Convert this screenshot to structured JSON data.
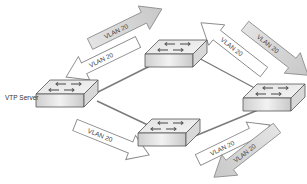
{
  "diagram": {
    "type": "network-topology",
    "server_label": "VTP Server",
    "arrow_label": "VLAN 20",
    "colors": {
      "link": "#7a7a7a",
      "arrow_filled": "#d4d4d4",
      "arrow_outline": "#8a8a8a",
      "switch_top": "#e8e8e8",
      "switch_front": "#d0d0d0",
      "switch_side": "#bdbdbd"
    },
    "switches": [
      {
        "id": "sw-left",
        "role": "VTP Server"
      },
      {
        "id": "sw-top",
        "role": ""
      },
      {
        "id": "sw-right",
        "role": ""
      },
      {
        "id": "sw-bottom",
        "role": ""
      }
    ],
    "links": [
      {
        "from": "sw-left",
        "to": "sw-top"
      },
      {
        "from": "sw-top",
        "to": "sw-right"
      },
      {
        "from": "sw-left",
        "to": "sw-bottom"
      },
      {
        "from": "sw-bottom",
        "to": "sw-right"
      }
    ],
    "arrows": [
      {
        "label": "VLAN 20",
        "style": "filled",
        "direction": "outbound",
        "near": "sw-top-left"
      },
      {
        "label": "VLAN 20",
        "style": "outline",
        "direction": "inbound",
        "near": "sw-left"
      },
      {
        "label": "VLAN 20",
        "style": "outline",
        "direction": "inbound",
        "near": "sw-top-right"
      },
      {
        "label": "VLAN 20",
        "style": "filled",
        "direction": "outbound",
        "near": "sw-right"
      },
      {
        "label": "VLAN 20",
        "style": "outline",
        "direction": "outbound",
        "near": "sw-bottom"
      },
      {
        "label": "VLAN 20",
        "style": "outline",
        "direction": "inbound",
        "near": "sw-bottom-right"
      },
      {
        "label": "VLAN 20",
        "style": "filled",
        "direction": "outbound",
        "near": "sw-bottom-far-right"
      }
    ]
  }
}
